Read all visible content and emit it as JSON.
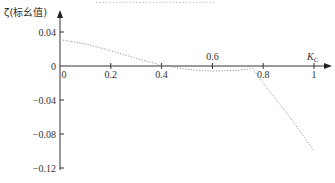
{
  "header": {
    "cut_title": "………………………………"
  },
  "chart_data": {
    "type": "line",
    "title": "",
    "xlabel": "Kc",
    "xlabel_main": "K",
    "xlabel_sub": "C",
    "ylabel": "ζ(标幺值)",
    "xlim": [
      0,
      1
    ],
    "ylim": [
      -0.12,
      0.05
    ],
    "x_ticks_above": [
      0.6,
      "Kc"
    ],
    "x_ticks": [
      0,
      0.2,
      0.4,
      0.6,
      0.8,
      1
    ],
    "x_tick_labels": [
      "0",
      "0.2",
      "0.4",
      "0.6",
      "0.8",
      "1"
    ],
    "y_ticks": [
      0.04,
      0,
      -0.04,
      -0.08,
      -0.12
    ],
    "y_tick_labels": [
      "0.04",
      "0",
      "-0.04",
      "-0.08",
      "-0.12"
    ],
    "grid": false,
    "legend": null,
    "series": [
      {
        "name": "ζ",
        "style": "dotted",
        "color": "#999999",
        "x": [
          0,
          0.1,
          0.2,
          0.3,
          0.4,
          0.5,
          0.6,
          0.7,
          0.76,
          0.8,
          0.9,
          1.0
        ],
        "y": [
          0.031,
          0.026,
          0.018,
          0.009,
          0.001,
          -0.004,
          -0.006,
          -0.005,
          -0.003,
          -0.02,
          -0.058,
          -0.1
        ]
      }
    ]
  }
}
